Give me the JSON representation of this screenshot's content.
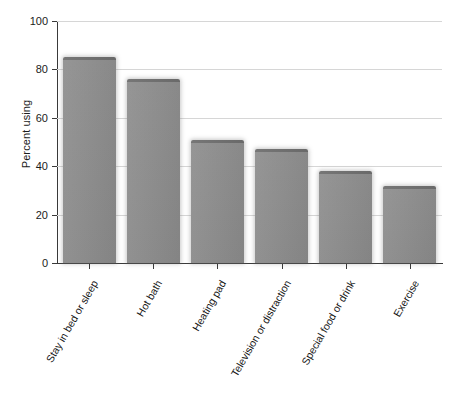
{
  "chart_data": {
    "type": "bar",
    "title": "",
    "xlabel": "",
    "ylabel": "Percent using",
    "ylim": [
      0,
      100
    ],
    "yticks": [
      0,
      20,
      40,
      60,
      80,
      100
    ],
    "ytick_labels": [
      "0",
      "20",
      "40",
      "60",
      "80",
      "100"
    ],
    "grid": "horizontal",
    "legend": "none",
    "bar_color": "#8b8b8b",
    "bar_edge_color": "#6f6f6f",
    "gridline_color": "#d6d6d6",
    "axis_color": "#3a3a3a",
    "categories": [
      "Stay in bed or sleep",
      "Hot bath",
      "Heating pad",
      "Television or distraction",
      "Special food or drink",
      "Exercise"
    ],
    "values": [
      85,
      76,
      51,
      47,
      38,
      32
    ],
    "series": [
      {
        "name": "Percent using",
        "values": [
          85,
          76,
          51,
          47,
          38,
          32
        ]
      }
    ]
  }
}
